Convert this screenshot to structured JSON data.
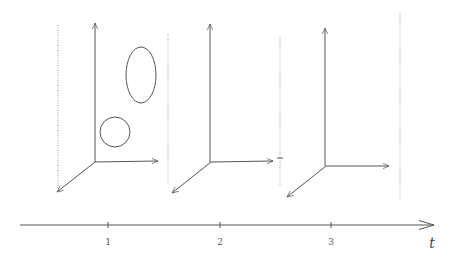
{
  "figure": {
    "colors": {
      "ink": "#555555",
      "dotted": "#9a9a9a",
      "background": "#ffffff"
    }
  },
  "time_axis": {
    "label": "t",
    "ticks": [
      {
        "label": "1",
        "x": 108
      },
      {
        "label": "2",
        "x": 220
      },
      {
        "label": "3",
        "x": 331
      }
    ]
  },
  "panels": [
    {
      "name": "frame-1",
      "origin": [
        95,
        162
      ],
      "shapes": [
        "ellipse",
        "circle"
      ]
    },
    {
      "name": "frame-2",
      "origin": [
        211,
        162
      ],
      "shapes": []
    },
    {
      "name": "frame-3",
      "origin": [
        326,
        166
      ],
      "shapes": []
    }
  ]
}
